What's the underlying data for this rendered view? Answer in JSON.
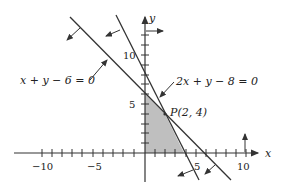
{
  "diagram": {
    "axes": {
      "x_label": "x",
      "y_label": "y",
      "x_ticks": [
        {
          "value": -10,
          "label": "−10"
        },
        {
          "value": -5,
          "label": "−5"
        },
        {
          "value": 5,
          "label": "5"
        },
        {
          "value": 10,
          "label": "10"
        }
      ],
      "y_ticks": [
        {
          "value": 5,
          "label": "5"
        },
        {
          "value": 10,
          "label": "10"
        }
      ]
    },
    "lines": [
      {
        "equation": "x + y − 6 = 0",
        "intercepts": {
          "x": 6,
          "y": 6
        }
      },
      {
        "equation": "2x + y − 8 = 0",
        "intercepts": {
          "x": 4,
          "y": 8
        }
      }
    ],
    "point": {
      "label": "P(2, 4)",
      "x": 2,
      "y": 4
    },
    "shaded_region": {
      "vertices": [
        [
          0,
          0
        ],
        [
          0,
          6
        ],
        [
          2,
          4
        ],
        [
          4,
          0
        ]
      ],
      "color": "#bfbfbf"
    },
    "colors": {
      "line": "#333333",
      "shade": "#bfbfbf"
    }
  }
}
